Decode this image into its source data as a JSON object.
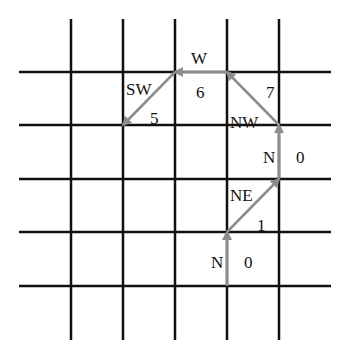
{
  "diagram": {
    "type": "grid-path",
    "grid": {
      "vertical_x": [
        71,
        123,
        175,
        227,
        279
      ],
      "horizontal_y": [
        72,
        125,
        179,
        232,
        286
      ],
      "x_extent": [
        19,
        331
      ],
      "y_extent": [
        19,
        340
      ],
      "line_color": "#111111",
      "line_width": 2.5
    },
    "path_color": "#8c8c8c",
    "steps": [
      {
        "from": [
          227,
          286
        ],
        "to": [
          227,
          232
        ],
        "direction": "N",
        "code": "0",
        "dir_label_pos": [
          211,
          264
        ],
        "code_label_pos": [
          244,
          264
        ]
      },
      {
        "from": [
          227,
          232
        ],
        "to": [
          279,
          179
        ],
        "direction": "NE",
        "code": "1",
        "dir_label_pos": [
          230,
          197
        ],
        "code_label_pos": [
          257,
          227
        ]
      },
      {
        "from": [
          279,
          179
        ],
        "to": [
          279,
          125
        ],
        "direction": "N",
        "code": "0",
        "dir_label_pos": [
          263,
          159
        ],
        "code_label_pos": [
          296,
          159
        ]
      },
      {
        "from": [
          279,
          125
        ],
        "to": [
          227,
          72
        ],
        "direction": "NW",
        "code": "7",
        "dir_label_pos": [
          230,
          124
        ],
        "code_label_pos": [
          266,
          94
        ]
      },
      {
        "from": [
          227,
          72
        ],
        "to": [
          175,
          72
        ],
        "direction": "W",
        "code": "6",
        "dir_label_pos": [
          191,
          60
        ],
        "code_label_pos": [
          196,
          94
        ]
      },
      {
        "from": [
          175,
          72
        ],
        "to": [
          123,
          125
        ],
        "direction": "SW",
        "code": "5",
        "dir_label_pos": [
          126,
          91
        ],
        "code_label_pos": [
          150,
          120
        ]
      }
    ]
  }
}
